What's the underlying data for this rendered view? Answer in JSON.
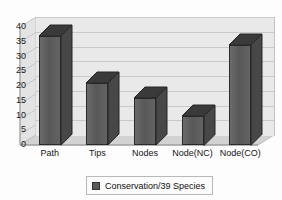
{
  "chart_data": {
    "type": "bar",
    "title": "",
    "subtitle": "",
    "xlabel": "",
    "ylabel": "",
    "categories": [
      "Path",
      "Tips",
      "Nodes",
      "Node(NC)",
      "Node(CO)"
    ],
    "series": [
      {
        "name": "Conservation/39 Species",
        "values": [
          37,
          21,
          16,
          10,
          34
        ],
        "color": "#5f5f5f"
      }
    ],
    "ylim": [
      0,
      40
    ],
    "ytick_values": [
      0,
      5,
      10,
      15,
      20,
      25,
      30,
      35,
      40
    ],
    "ytick_labels": [
      "0",
      "5",
      "10",
      "15",
      "20",
      "25",
      "30",
      "35",
      "40"
    ],
    "grid": true,
    "grid_axis": "y",
    "legend": true,
    "legend_position": "bottom",
    "three_d": true,
    "plot_background": "#e9e9e9",
    "gridline_color": "#c9c9c9",
    "axis_text_color": "#1a1a1a"
  },
  "legend": {
    "entries": [
      {
        "label": "Conservation/39 Species",
        "swatch_color": "#5a5a5a"
      }
    ]
  }
}
